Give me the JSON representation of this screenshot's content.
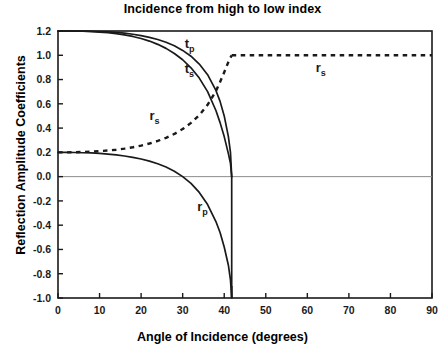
{
  "chart_data": {
    "type": "line",
    "title": "Incidence from high to low index",
    "xlabel": "Angle of Incidence (degrees)",
    "ylabel": "Reflection Amplitude Coefficients",
    "xlim": [
      0,
      90
    ],
    "ylim": [
      -1.0,
      1.2
    ],
    "xticks": [
      "0",
      "10",
      "20",
      "30",
      "40",
      "50",
      "60",
      "70",
      "80",
      "90"
    ],
    "yticks": [
      "1.2",
      "1.0",
      "0.8",
      "0.6",
      "0.4",
      "0.2",
      "0.0",
      "-0.2",
      "-0.4",
      "-0.6",
      "-0.8",
      "-1.0"
    ],
    "grid": false,
    "legend": "inline-annotations",
    "critical_angle": 41.8,
    "zero_line": 0.0,
    "annotations": [
      {
        "text": "t",
        "sub": "p",
        "x": 30.5,
        "y": 1.06
      },
      {
        "text": "t",
        "sub": "s",
        "x": 30.5,
        "y": 0.855
      },
      {
        "text": "r",
        "sub": "s",
        "x": 22.0,
        "y": 0.47
      },
      {
        "text": "r",
        "sub": "s",
        "x": 62.0,
        "y": 0.86
      },
      {
        "text": "r",
        "sub": "p",
        "x": 33.5,
        "y": -0.28
      }
    ],
    "series": [
      {
        "name": "t_p",
        "style": "solid",
        "x": [
          0,
          2,
          4,
          6,
          8,
          10,
          12,
          14,
          16,
          18,
          20,
          22,
          24,
          26,
          28,
          30,
          32,
          34,
          36,
          38,
          39,
          40,
          41,
          41.5,
          41.8,
          41.8
        ],
        "values": [
          1.2,
          1.2,
          1.2,
          1.2,
          1.198,
          1.196,
          1.193,
          1.188,
          1.182,
          1.173,
          1.162,
          1.148,
          1.13,
          1.107,
          1.078,
          1.04,
          0.992,
          0.928,
          0.84,
          0.71,
          0.62,
          0.5,
          0.33,
          0.2,
          0.0,
          0.0
        ]
      },
      {
        "name": "t_s",
        "style": "solid",
        "x": [
          0,
          2,
          4,
          6,
          8,
          10,
          12,
          14,
          16,
          18,
          20,
          22,
          24,
          26,
          28,
          30,
          32,
          34,
          36,
          38,
          39,
          40,
          41,
          41.5,
          41.8,
          41.8
        ],
        "values": [
          1.2,
          1.2,
          1.199,
          1.198,
          1.195,
          1.191,
          1.186,
          1.178,
          1.168,
          1.155,
          1.138,
          1.117,
          1.09,
          1.057,
          1.015,
          0.963,
          0.897,
          0.812,
          0.7,
          0.545,
          0.445,
          0.33,
          0.19,
          0.11,
          0.0,
          0.0
        ]
      },
      {
        "name": "r_p",
        "style": "solid",
        "x": [
          0,
          2,
          4,
          6,
          8,
          10,
          12,
          14,
          16,
          18,
          20,
          22,
          24,
          26,
          28,
          30,
          32,
          34,
          36,
          38,
          39,
          40,
          41,
          41.5,
          41.8,
          41.8
        ],
        "values": [
          0.2,
          0.2,
          0.199,
          0.197,
          0.195,
          0.191,
          0.186,
          0.179,
          0.17,
          0.159,
          0.145,
          0.128,
          0.106,
          0.079,
          0.045,
          0.0,
          -0.055,
          -0.13,
          -0.23,
          -0.37,
          -0.46,
          -0.58,
          -0.73,
          -0.85,
          -1.0,
          -1.0
        ]
      },
      {
        "name": "r_s_pre",
        "style": "dotted",
        "x": [
          0,
          2,
          4,
          6,
          8,
          10,
          12,
          14,
          16,
          18,
          20,
          22,
          24,
          26,
          28,
          30,
          32,
          34,
          36,
          38,
          39,
          40,
          41,
          41.5,
          41.8
        ],
        "values": [
          0.2,
          0.2,
          0.201,
          0.203,
          0.206,
          0.21,
          0.215,
          0.222,
          0.231,
          0.242,
          0.256,
          0.273,
          0.294,
          0.32,
          0.352,
          0.392,
          0.443,
          0.507,
          0.592,
          0.705,
          0.78,
          0.86,
          0.945,
          0.98,
          1.0
        ]
      },
      {
        "name": "r_s_post",
        "style": "dotted",
        "x": [
          41.8,
          45,
          50,
          55,
          60,
          65,
          70,
          75,
          80,
          85,
          90
        ],
        "values": [
          1.0,
          1.0,
          1.0,
          1.0,
          1.0,
          1.0,
          1.0,
          1.0,
          1.0,
          1.0,
          1.0
        ]
      }
    ]
  },
  "colors": {
    "axis": "#1a1a1a",
    "curve": "#1a1a1a",
    "zero_line": "#8c8c8c",
    "background": "#ffffff"
  }
}
